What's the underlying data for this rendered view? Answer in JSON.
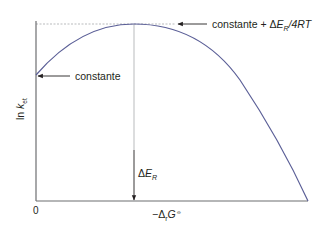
{
  "diagram": {
    "type": "marcus-parabola",
    "y_axis_label": {
      "prefix": "ln ",
      "var": "k",
      "sub": "et"
    },
    "x_axis_label": {
      "prefix": "−Δ",
      "sub": "r",
      "var": "G",
      "sup": "⦵"
    },
    "origin_label": "0",
    "annotations": {
      "intercept": {
        "text": "constante"
      },
      "maximum": {
        "prefix": "constante + Δ",
        "var": "E",
        "sub": "R",
        "suffix": "/4RT"
      },
      "reorg": {
        "prefix": "Δ",
        "var": "E",
        "sub": "R"
      }
    },
    "colors": {
      "curve": "#5b5f97",
      "axis": "#6d6e71",
      "guide": "#a7a9ac",
      "text": "#231f20"
    }
  }
}
